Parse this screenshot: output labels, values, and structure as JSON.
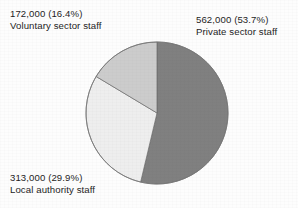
{
  "chart_data": {
    "type": "pie",
    "title": "",
    "legend_position": "callout-labels",
    "start_angle_deg": 0,
    "direction": "clockwise",
    "units": "staff",
    "categories": [
      "Private sector staff",
      "Local authority staff",
      "Voluntary sector staff"
    ],
    "values": [
      562000,
      313000,
      172000
    ],
    "percentages": [
      53.7,
      29.9,
      16.4
    ],
    "colors": [
      "#808080",
      "#eeeeee",
      "#cccccc"
    ],
    "slices": [
      {
        "name": "Private sector staff",
        "value": 562000,
        "value_text": "562,000",
        "percent": 53.7,
        "percent_text": "(53.7%)",
        "label_line1": "562,000 (53.7%)",
        "label_line2": "Private sector staff",
        "color": "#808080"
      },
      {
        "name": "Local authority staff",
        "value": 313000,
        "value_text": "313,000",
        "percent": 29.9,
        "percent_text": "(29.9%)",
        "label_line1": "313,000 (29.9%)",
        "label_line2": "Local authority staff",
        "color": "#eeeeee"
      },
      {
        "name": "Voluntary sector staff",
        "value": 172000,
        "value_text": "172,000",
        "percent": 16.4,
        "percent_text": "(16.4%)",
        "label_line1": "172,000 (16.4%)",
        "label_line2": "Voluntary sector staff",
        "color": "#cccccc"
      }
    ]
  },
  "labels": {
    "voluntary": {
      "line1": "172,000 (16.4%)",
      "line2": "Voluntary sector staff"
    },
    "private": {
      "line1": "562,000 (53.7%)",
      "line2": "Private sector staff"
    },
    "local": {
      "line1": "313,000 (29.9%)",
      "line2": "Local authority staff"
    }
  },
  "style": {
    "background": "#fdfdfd",
    "text_color": "#1d1d1d",
    "slice_outline": "#6b6b6b"
  }
}
